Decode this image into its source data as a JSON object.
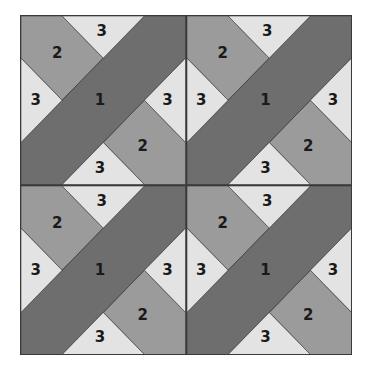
{
  "diagram": {
    "type": "quilt-block-layout",
    "grid": {
      "rows": 2,
      "cols": 2
    },
    "colors": {
      "piece_1": "#6e6e6e",
      "piece_2": "#9b9b9b",
      "piece_3": "#e3e3e3",
      "outline": "#3a3a3a"
    },
    "blocks": [
      {
        "position": "top-left",
        "labels": {
          "p2_tl": "2",
          "p3_top": "3",
          "p3_left": "3",
          "p1": "1",
          "p3_right": "3",
          "p2_br": "2",
          "p3_bottom": "3"
        }
      },
      {
        "position": "top-right",
        "labels": {
          "p2_tl": "2",
          "p3_top": "3",
          "p3_left": "3",
          "p1": "1",
          "p3_right": "3",
          "p2_br": "2",
          "p3_bottom": "3"
        }
      },
      {
        "position": "bottom-left",
        "labels": {
          "p2_tl": "2",
          "p3_top": "3",
          "p3_left": "3",
          "p1": "1",
          "p3_right": "3",
          "p2_br": "2",
          "p3_bottom": "3"
        }
      },
      {
        "position": "bottom-right",
        "labels": {
          "p2_tl": "2",
          "p3_top": "3",
          "p3_left": "3",
          "p1": "1",
          "p3_right": "3",
          "p2_br": "2",
          "p3_bottom": "3"
        }
      }
    ]
  }
}
